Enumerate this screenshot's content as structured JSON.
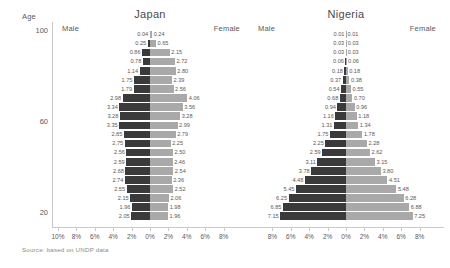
{
  "axis": {
    "y_title": "Age",
    "y_ticks": [
      "100",
      "60",
      "20"
    ],
    "x_ticks_left": [
      "10%",
      "8%",
      "6%",
      "4%",
      "2%",
      "0%",
      "2%",
      "4%",
      "6%",
      "8%"
    ],
    "x_ticks_right": [
      "8%",
      "6%",
      "4%",
      "2%",
      "0%",
      "2%",
      "4%",
      "6%",
      "8%"
    ]
  },
  "source_note": "Source: based on UNDP data",
  "colors": {
    "male_bar": "#3a3a3a",
    "female_bar": "#a9a9a9",
    "axis": "#c9c9c9",
    "text": "#5a5a5a"
  },
  "panels": [
    {
      "title": "Japan",
      "male_label": "Male",
      "female_label": "Female"
    },
    {
      "title": "Nigeria",
      "male_label": "Male",
      "female_label": "Female"
    }
  ],
  "chart_data": {
    "type": "bar",
    "subtype": "population-pyramid",
    "xlabel": "Share of total population (%)",
    "ylabel": "Age",
    "xlim": [
      -10,
      10
    ],
    "grid": false,
    "legend": [
      "Male",
      "Female"
    ],
    "legend_position": "panel-headers",
    "age_groups": [
      "100+",
      "95-99",
      "90-94",
      "85-89",
      "80-84",
      "75-79",
      "70-74",
      "65-69",
      "60-64",
      "55-59",
      "50-54",
      "45-49",
      "40-44",
      "35-39",
      "30-34",
      "25-29",
      "20-24",
      "15-19",
      "10-14",
      "5-9",
      "0-4"
    ],
    "charts": [
      {
        "name": "Japan",
        "series": [
          {
            "name": "Male",
            "values": [
              0.04,
              0.25,
              0.86,
              0.78,
              1.14,
              1.75,
              1.79,
              2.98,
              3.34,
              3.28,
              3.35,
              2.85,
              2.75,
              2.56,
              2.59,
              2.68,
              2.74,
              2.55,
              2.15,
              1.96,
              2.05
            ]
          },
          {
            "name": "Female",
            "values": [
              0.24,
              0.65,
              2.15,
              2.72,
              2.8,
              2.39,
              2.56,
              4.06,
              3.56,
              3.28,
              2.99,
              2.79,
              2.25,
              2.5,
              2.46,
              2.54,
              2.36,
              2.52,
              2.06,
              1.98,
              1.96
            ]
          }
        ]
      },
      {
        "name": "Nigeria",
        "series": [
          {
            "name": "Male",
            "values": [
              0.01,
              0.03,
              0.03,
              0.06,
              0.18,
              0.37,
              0.54,
              0.68,
              0.94,
              1.16,
              1.31,
              1.75,
              2.25,
              2.59,
              3.11,
              3.78,
              4.48,
              5.45,
              6.25,
              6.85,
              7.15
            ]
          },
          {
            "name": "Female",
            "values": [
              0.01,
              0.03,
              0.03,
              0.06,
              0.18,
              0.38,
              0.55,
              0.7,
              0.96,
              1.18,
              1.34,
              1.78,
              2.28,
              2.62,
              3.15,
              3.8,
              4.51,
              5.48,
              6.28,
              6.88,
              7.25
            ]
          }
        ]
      }
    ]
  }
}
